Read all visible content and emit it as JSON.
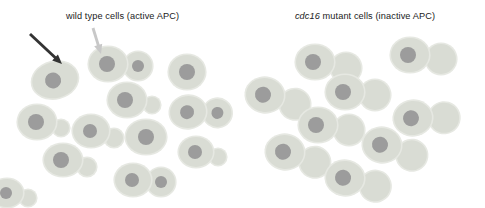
{
  "figure": {
    "background_color": "#ffffff",
    "width": 485,
    "height": 208
  },
  "palette": {
    "cell_fill": "#d9dcd4",
    "cell_rim": "#e6e8e2",
    "nucleus_fill": "#9c9c9c",
    "dark_arrow": "#333333",
    "light_arrow": "#c8c8c8",
    "text": "#1a1a1a"
  },
  "panels": {
    "wild_type": {
      "label_prefix": "",
      "label_text": "wild type cells (active APC)",
      "cells": [
        {
          "name": "unbudded-cell-1",
          "x": 55,
          "y": 80,
          "rx": 23,
          "ry": 18,
          "rot": -14,
          "nucleus_r": 8,
          "nx": -2,
          "ny": 0,
          "bud": null
        },
        {
          "name": "large-budded-cell-1",
          "x": 108,
          "y": 64,
          "rx": 19,
          "ry": 17,
          "rot": 0,
          "nucleus_r": 8,
          "nx": -1,
          "ny": 0,
          "bud": {
            "r": 14,
            "dx": 30,
            "dy": 2,
            "nucleus_r": 6
          }
        },
        {
          "name": "unbudded-cell-2",
          "x": 187,
          "y": 72,
          "rx": 18,
          "ry": 17,
          "rot": 0,
          "nucleus_r": 8,
          "nx": 0,
          "ny": 0,
          "bud": null
        },
        {
          "name": "small-budded-cell-1",
          "x": 37,
          "y": 122,
          "rx": 19,
          "ry": 17,
          "rot": 0,
          "nucleus_r": 8,
          "nx": -1,
          "ny": 0,
          "bud": {
            "r": 8,
            "dx": 24,
            "dy": 6,
            "nucleus_r": 0
          }
        },
        {
          "name": "small-budded-cell-2",
          "x": 91,
          "y": 131,
          "rx": 18,
          "ry": 16,
          "rot": 0,
          "nucleus_r": 7,
          "nx": -1,
          "ny": 0,
          "bud": {
            "r": 9,
            "dx": 23,
            "dy": 7,
            "nucleus_r": 0
          }
        },
        {
          "name": "small-budded-cell-3",
          "x": 127,
          "y": 100,
          "rx": 19,
          "ry": 17,
          "rot": 0,
          "nucleus_r": 8,
          "nx": -2,
          "ny": 0,
          "bud": {
            "r": 8,
            "dx": 25,
            "dy": 5,
            "nucleus_r": 0
          }
        },
        {
          "name": "unbudded-cell-3",
          "x": 146,
          "y": 137,
          "rx": 20,
          "ry": 17,
          "rot": 0,
          "nucleus_r": 8,
          "nx": 0,
          "ny": 0,
          "bud": null
        },
        {
          "name": "large-budded-cell-2",
          "x": 188,
          "y": 112,
          "rx": 18,
          "ry": 16,
          "rot": -8,
          "nucleus_r": 7,
          "nx": -1,
          "ny": 0,
          "bud": {
            "r": 14,
            "dx": 29,
            "dy": 5,
            "nucleus_r": 6
          }
        },
        {
          "name": "small-budded-cell-4",
          "x": 63,
          "y": 160,
          "rx": 19,
          "ry": 16,
          "rot": 0,
          "nucleus_r": 8,
          "nx": -2,
          "ny": 0,
          "bud": {
            "r": 9,
            "dx": 24,
            "dy": 7,
            "nucleus_r": 0
          }
        },
        {
          "name": "small-budded-cell-5",
          "x": 196,
          "y": 152,
          "rx": 17,
          "ry": 15,
          "rot": 0,
          "nucleus_r": 7,
          "nx": -1,
          "ny": 0,
          "bud": {
            "r": 8,
            "dx": 22,
            "dy": 5,
            "nucleus_r": 0
          }
        },
        {
          "name": "large-budded-cell-3",
          "x": 133,
          "y": 180,
          "rx": 18,
          "ry": 16,
          "rot": 0,
          "nucleus_r": 7,
          "nx": -1,
          "ny": 0,
          "bud": {
            "r": 14,
            "dx": 28,
            "dy": 2,
            "nucleus_r": 6
          }
        },
        {
          "name": "small-budded-cell-6",
          "x": 7,
          "y": 193,
          "rx": 16,
          "ry": 14,
          "rot": 0,
          "nucleus_r": 6,
          "nx": -1,
          "ny": 0,
          "bud": {
            "r": 8,
            "dx": 21,
            "dy": 5,
            "nucleus_r": 0
          }
        }
      ],
      "annotations": [
        {
          "name": "unbudded-cell-arrow",
          "color": "#333333",
          "x1": 30,
          "y1": 34,
          "x2": 62,
          "y2": 64
        },
        {
          "name": "budded-cell-arrow",
          "color": "#c8c8c8",
          "x1": 93,
          "y1": 28,
          "x2": 101,
          "y2": 54
        }
      ]
    },
    "mutant": {
      "label_gene": "cdc16",
      "label_text": " mutant cells (inactive APC)",
      "cells": [
        {
          "name": "arrested-budded-cell-1",
          "x": 70,
          "y": 62,
          "rx": 19,
          "ry": 17,
          "rot": 0,
          "nucleus_r": 8,
          "nx": -2,
          "ny": 0,
          "bud": {
            "r": 15,
            "dx": 31,
            "dy": 6,
            "nucleus_r": 0
          }
        },
        {
          "name": "arrested-budded-cell-2",
          "x": 165,
          "y": 55,
          "rx": 19,
          "ry": 17,
          "rot": 0,
          "nucleus_r": 8,
          "nx": -2,
          "ny": 0,
          "bud": {
            "r": 15,
            "dx": 31,
            "dy": 4,
            "nucleus_r": 0
          }
        },
        {
          "name": "arrested-budded-cell-3",
          "x": 20,
          "y": 95,
          "rx": 19,
          "ry": 17,
          "rot": 8,
          "nucleus_r": 8,
          "nx": -2,
          "ny": 0,
          "bud": {
            "r": 15,
            "dx": 31,
            "dy": 5,
            "nucleus_r": 0
          }
        },
        {
          "name": "arrested-budded-cell-4",
          "x": 100,
          "y": 92,
          "rx": 19,
          "ry": 17,
          "rot": 0,
          "nucleus_r": 8,
          "nx": -2,
          "ny": 0,
          "bud": {
            "r": 15,
            "dx": 30,
            "dy": 3,
            "nucleus_r": 0
          }
        },
        {
          "name": "arrested-budded-cell-5",
          "x": 73,
          "y": 125,
          "rx": 19,
          "ry": 17,
          "rot": 0,
          "nucleus_r": 8,
          "nx": -2,
          "ny": 0,
          "bud": {
            "r": 15,
            "dx": 31,
            "dy": 5,
            "nucleus_r": 0
          }
        },
        {
          "name": "arrested-budded-cell-6",
          "x": 168,
          "y": 118,
          "rx": 19,
          "ry": 17,
          "rot": -6,
          "nucleus_r": 8,
          "nx": -2,
          "ny": 0,
          "bud": {
            "r": 15,
            "dx": 31,
            "dy": 3,
            "nucleus_r": 0
          }
        },
        {
          "name": "arrested-budded-cell-7",
          "x": 137,
          "y": 145,
          "rx": 19,
          "ry": 17,
          "rot": 8,
          "nucleus_r": 8,
          "nx": -2,
          "ny": 0,
          "bud": {
            "r": 15,
            "dx": 31,
            "dy": 6,
            "nucleus_r": 0
          }
        },
        {
          "name": "arrested-budded-cell-8",
          "x": 40,
          "y": 152,
          "rx": 19,
          "ry": 17,
          "rot": 8,
          "nucleus_r": 8,
          "nx": -2,
          "ny": 0,
          "bud": {
            "r": 15,
            "dx": 31,
            "dy": 6,
            "nucleus_r": 0
          }
        },
        {
          "name": "arrested-budded-cell-9",
          "x": 100,
          "y": 178,
          "rx": 19,
          "ry": 17,
          "rot": 6,
          "nucleus_r": 8,
          "nx": -2,
          "ny": 0,
          "bud": {
            "r": 15,
            "dx": 31,
            "dy": 5,
            "nucleus_r": 0
          }
        }
      ],
      "annotations": []
    }
  }
}
